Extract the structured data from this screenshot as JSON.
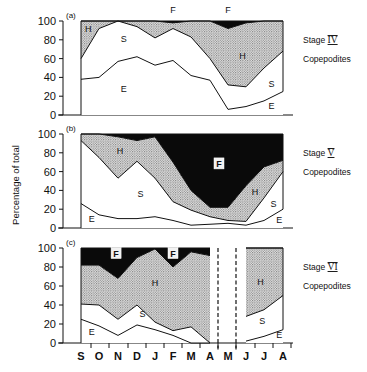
{
  "chart_data": {
    "type": "area",
    "ylabel": "Percentage of total",
    "categories": [
      "S",
      "O",
      "N",
      "D",
      "J",
      "F",
      "M",
      "A",
      "M",
      "J",
      "J",
      "A"
    ],
    "yticks": [
      0,
      20,
      40,
      60,
      80,
      100
    ],
    "ylim": [
      0,
      100
    ],
    "legend_codes": [
      "E",
      "S",
      "H",
      "F"
    ],
    "panels": [
      {
        "id": "a",
        "label": "(a)",
        "side_title": "Stage IV",
        "side_title_numeral": "IV",
        "side_subtitle": "Copepodites",
        "cumulative_tops": {
          "E": [
            38,
            40,
            57,
            62,
            53,
            58,
            42,
            37,
            6,
            9,
            15,
            25
          ],
          "S": [
            60,
            92,
            100,
            94,
            82,
            92,
            83,
            60,
            32,
            30,
            50,
            68
          ],
          "H": [
            100,
            100,
            100,
            100,
            100,
            98,
            100,
            100,
            92,
            98,
            100,
            100
          ],
          "F": [
            100,
            100,
            100,
            100,
            100,
            100,
            100,
            100,
            100,
            100,
            100,
            100
          ]
        },
        "region_labels": [
          {
            "text": "H",
            "month_index": 0.4,
            "value": 88
          },
          {
            "text": "S",
            "month_index": 2.3,
            "value": 78
          },
          {
            "text": "E",
            "month_index": 2.3,
            "value": 24
          },
          {
            "text": "F",
            "month_index": 5.0,
            "value": 108
          },
          {
            "text": "F",
            "month_index": 8.0,
            "value": 108
          },
          {
            "text": "H",
            "month_index": 8.8,
            "value": 60
          },
          {
            "text": "S",
            "month_index": 10.4,
            "value": 30
          },
          {
            "text": "E",
            "month_index": 10.4,
            "value": 6
          }
        ]
      },
      {
        "id": "b",
        "label": "(b)",
        "side_title": "Stage V",
        "side_title_numeral": "V",
        "side_subtitle": "Copepodites",
        "cumulative_tops": {
          "E": [
            26,
            14,
            10,
            10,
            12,
            8,
            3,
            4,
            5,
            3,
            8,
            20
          ],
          "S": [
            93,
            75,
            53,
            71,
            53,
            28,
            19,
            12,
            8,
            7,
            32,
            60
          ],
          "H": [
            100,
            100,
            97,
            93,
            97,
            70,
            40,
            22,
            22,
            45,
            65,
            72
          ],
          "F": [
            100,
            100,
            100,
            100,
            100,
            100,
            100,
            100,
            100,
            100,
            100,
            100
          ]
        },
        "region_labels": [
          {
            "text": "H",
            "month_index": 2.1,
            "value": 79,
            "boxed": false
          },
          {
            "text": "S",
            "month_index": 3.2,
            "value": 33,
            "boxed": false
          },
          {
            "text": "E",
            "month_index": 0.6,
            "value": 6,
            "boxed": false
          },
          {
            "text": "F",
            "month_index": 7.5,
            "value": 65,
            "boxed": true
          },
          {
            "text": "H",
            "month_index": 9.5,
            "value": 35,
            "boxed": false
          },
          {
            "text": "S",
            "month_index": 10.5,
            "value": 22,
            "boxed": false
          },
          {
            "text": "E",
            "month_index": 10.8,
            "value": 5,
            "boxed": false
          }
        ]
      },
      {
        "id": "c",
        "label": "(c)",
        "side_title": "Stage VI",
        "side_title_numeral": "VI",
        "side_subtitle": "Copepodites",
        "segments": [
          {
            "month_range": [
              0,
              7
            ],
            "end_dashed": true,
            "cumulative_tops": {
              "E": [
                25,
                18,
                8,
                19,
                14,
                8,
                0,
                0
              ],
              "S": [
                41,
                40,
                25,
                40,
                22,
                13,
                17,
                0
              ],
              "H": [
                82,
                82,
                68,
                90,
                99,
                80,
                96,
                92
              ],
              "F": [
                100,
                100,
                100,
                100,
                100,
                100,
                100,
                100
              ]
            }
          },
          {
            "month_range": [
              9,
              11
            ],
            "start_dashed": true,
            "cumulative_tops": {
              "E": [
                2,
                7,
                14
              ],
              "S": [
                28,
                35,
                50
              ],
              "H": [
                100,
                100,
                100
              ],
              "F": [
                100,
                100,
                100
              ]
            }
          }
        ],
        "region_labels": [
          {
            "text": "F",
            "month_index": 1.9,
            "value": 91,
            "boxed": true
          },
          {
            "text": "F",
            "month_index": 5.0,
            "value": 91,
            "boxed": true
          },
          {
            "text": "H",
            "month_index": 4.0,
            "value": 60,
            "boxed": false
          },
          {
            "text": "S",
            "month_index": 3.3,
            "value": 27,
            "boxed": false
          },
          {
            "text": "E",
            "month_index": 0.6,
            "value": 8,
            "boxed": false
          },
          {
            "text": "H",
            "month_index": 9.8,
            "value": 61,
            "boxed": false
          },
          {
            "text": "S",
            "month_index": 9.9,
            "value": 20,
            "boxed": false
          },
          {
            "text": "E",
            "month_index": 10.8,
            "value": 5,
            "boxed": false
          }
        ]
      }
    ]
  },
  "colors": {
    "line": "#111111",
    "F_fill": "#0a0a0a",
    "H_dot": "#555555",
    "background": "#ffffff"
  }
}
